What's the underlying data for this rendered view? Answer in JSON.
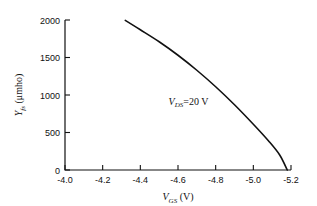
{
  "chart_data": {
    "type": "line",
    "title": "",
    "xlabel": "V_GS (V)",
    "ylabel": "Y_fs (μmho)",
    "xlabel_main": "V",
    "xlabel_sub": "GS",
    "xlabel_unit": "(V)",
    "ylabel_main": "Y",
    "ylabel_sub": "fs",
    "ylabel_unit": "(μmho)",
    "xlim": [
      -4.0,
      -5.2
    ],
    "ylim": [
      0,
      2000
    ],
    "x_reversed": true,
    "grid": false,
    "legend": null,
    "xticks": [
      "-4.0",
      "-4.2",
      "-4.4",
      "-4.6",
      "-4.8",
      "-5.0",
      "-5.2"
    ],
    "xtick_values": [
      -4.0,
      -4.2,
      -4.4,
      -4.6,
      -4.8,
      -5.0,
      -5.2
    ],
    "yticks": [
      "0",
      "500",
      "1000",
      "1500",
      "2000"
    ],
    "ytick_values": [
      0,
      500,
      1000,
      1500,
      2000
    ],
    "annotations": [
      {
        "name": "vds-annotation",
        "main": "V",
        "sub": "DS",
        "rest": "=20 V",
        "x": -4.55,
        "y": 870
      }
    ],
    "series": [
      {
        "name": "Yfs vs Vgs",
        "color": "#111111",
        "x": [
          -4.32,
          -4.4,
          -4.5,
          -4.6,
          -4.7,
          -4.8,
          -4.9,
          -5.0,
          -5.08,
          -5.14,
          -5.18
        ],
        "y": [
          1995,
          1870,
          1710,
          1530,
          1330,
          1110,
          870,
          610,
          390,
          200,
          0
        ]
      }
    ]
  },
  "axes": {
    "left_px": 65,
    "right_px": 291,
    "top_px": 20,
    "bottom_px": 170
  },
  "colors": {
    "ink": "#111111",
    "background": "#ffffff"
  }
}
